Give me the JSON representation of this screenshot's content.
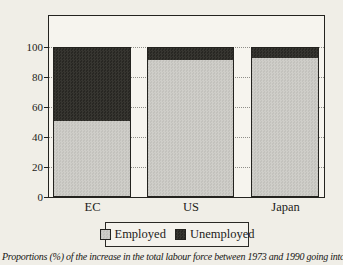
{
  "figure": {
    "caption": "Proportions (%) of the increase in the total labour force between 1973 and 1990 going into"
  },
  "chart_data": {
    "type": "bar",
    "stacked": true,
    "title": "",
    "xlabel": "",
    "ylabel": "",
    "categories": [
      "EC",
      "US",
      "Japan"
    ],
    "series": [
      {
        "name": "Employed",
        "values": [
          51,
          92,
          93
        ],
        "color": "#c8c7c1"
      },
      {
        "name": "Unemployed",
        "values": [
          49,
          8,
          7
        ],
        "color": "#2d2c29"
      }
    ],
    "ylim": [
      0,
      120
    ],
    "yticks": [
      0,
      20,
      40,
      60,
      80,
      100
    ],
    "grid": "horizontal-dotted",
    "legend": {
      "position": "bottom",
      "labels": [
        "Employed",
        "Unemployed"
      ]
    },
    "axis_color": "#24231f",
    "plot_bg": "#f6f4ee",
    "page_bg": "#f0eee7"
  }
}
